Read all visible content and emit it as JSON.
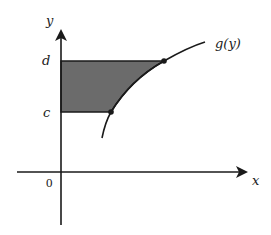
{
  "diagram": {
    "axes": {
      "x_label": "x",
      "y_label": "y",
      "origin_label": "0"
    },
    "levels": {
      "upper_label": "d",
      "lower_label": "c"
    },
    "curve": {
      "label": "g(y)"
    },
    "region": {
      "description": "Shaded region between y-axis and curve x = g(y), from y = c to y = d",
      "fill_color": "#6b6b6b"
    },
    "colors": {
      "stroke": "#1a1a1a",
      "background": "#ffffff"
    }
  }
}
